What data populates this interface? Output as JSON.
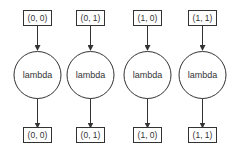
{
  "diagram": {
    "type": "dataflow-graph",
    "columns": [
      {
        "input": "(0, 0)",
        "op": "lambda",
        "output": "(0, 0)"
      },
      {
        "input": "(0, 1)",
        "op": "lambda",
        "output": "(0, 1)"
      },
      {
        "input": "(1, 0)",
        "op": "lambda",
        "output": "(1, 0)"
      },
      {
        "input": "(1, 1)",
        "op": "lambda",
        "output": "(1, 1)"
      }
    ],
    "colors": {
      "stroke": "#333333",
      "fill": "#ffffff",
      "text": "#333333"
    }
  }
}
